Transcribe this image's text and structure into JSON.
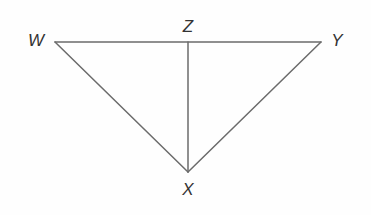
{
  "figure": {
    "type": "geometry-diagram",
    "background_color": "#fefefe",
    "stroke_color": "#6b6b6b",
    "stroke_width": 1.5,
    "label_color": "#333333",
    "label_style": "italic",
    "label_font_size": 17,
    "canvas": {
      "width": 371,
      "height": 215
    },
    "points": {
      "W": {
        "label": "W",
        "x": 55,
        "y": 42,
        "label_x": 36,
        "label_y": 40
      },
      "Z": {
        "label": "Z",
        "x": 188,
        "y": 42,
        "label_x": 188,
        "label_y": 26
      },
      "Y": {
        "label": "Y",
        "x": 321,
        "y": 42,
        "label_x": 337,
        "label_y": 40
      },
      "X": {
        "label": "X",
        "x": 188,
        "y": 172,
        "label_x": 188,
        "label_y": 189
      }
    },
    "segments": [
      {
        "name": "WY",
        "from": "W",
        "to": "Y",
        "x1": 55,
        "y1": 42,
        "x2": 321,
        "y2": 42
      },
      {
        "name": "WX",
        "from": "W",
        "to": "X",
        "x1": 55,
        "y1": 42,
        "x2": 188,
        "y2": 172
      },
      {
        "name": "XY",
        "from": "X",
        "to": "Y",
        "x1": 188,
        "y1": 172,
        "x2": 321,
        "y2": 42
      },
      {
        "name": "ZX",
        "from": "Z",
        "to": "X",
        "x1": 188,
        "y1": 42,
        "x2": 188,
        "y2": 172
      }
    ]
  }
}
